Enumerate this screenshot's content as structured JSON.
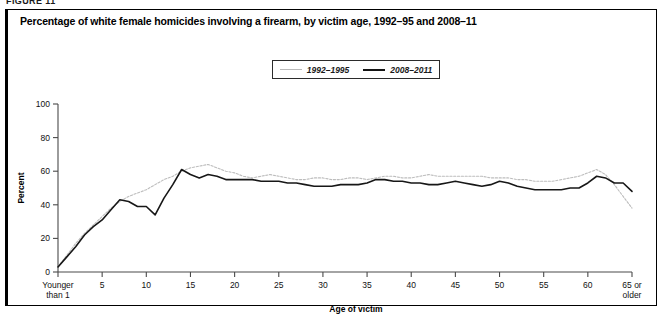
{
  "figure": {
    "number_label": "FIGURE 11",
    "title": "Percentage of white female homicides involving a firearm, by victim age, 1992–95 and 2008–11"
  },
  "legend": {
    "position": "top-center",
    "items": [
      {
        "label": "1992–1995",
        "style": "light-dotted",
        "color": "#bdbdbd"
      },
      {
        "label": "2008–2011",
        "style": "bold-solid",
        "color": "#171717"
      }
    ]
  },
  "axes": {
    "y_title": "Percent",
    "x_title": "Age of victim",
    "y_ticks": [
      "0",
      "20",
      "40",
      "60",
      "80",
      "100"
    ],
    "x_tick_labels": [
      "Younger than 1",
      "5",
      "10",
      "15",
      "20",
      "25",
      "30",
      "35",
      "40",
      "45",
      "50",
      "55",
      "60",
      "65 or older"
    ],
    "x_first_label_line1": "Younger",
    "x_first_label_line2": "than 1",
    "x_last_label_line1": "65 or",
    "x_last_label_line2": "older"
  },
  "chart_data": {
    "type": "line",
    "title": "Percentage of white female homicides involving a firearm, by victim age, 1992–95 and 2008–11",
    "xlabel": "Age of victim",
    "ylabel": "Percent",
    "xlim": [
      0,
      65
    ],
    "ylim": [
      0,
      100
    ],
    "grid": false,
    "legend_position": "top-center",
    "x": [
      0,
      1,
      2,
      3,
      4,
      5,
      6,
      7,
      8,
      9,
      10,
      11,
      12,
      13,
      14,
      15,
      16,
      17,
      18,
      19,
      20,
      21,
      22,
      23,
      24,
      25,
      26,
      27,
      28,
      29,
      30,
      31,
      32,
      33,
      34,
      35,
      36,
      37,
      38,
      39,
      40,
      41,
      42,
      43,
      44,
      45,
      46,
      47,
      48,
      49,
      50,
      51,
      52,
      53,
      54,
      55,
      56,
      57,
      58,
      59,
      60,
      61,
      62,
      63,
      64,
      65
    ],
    "x_tick_positions": [
      0,
      5,
      10,
      15,
      20,
      25,
      30,
      35,
      40,
      45,
      50,
      55,
      60,
      65
    ],
    "series": [
      {
        "name": "1992–1995",
        "color": "#bdbdbd",
        "style": "light-dotted",
        "values": [
          3,
          10,
          17,
          23,
          28,
          33,
          38,
          42,
          45,
          47,
          49,
          52,
          55,
          57,
          60,
          62,
          63,
          64,
          62,
          60,
          59,
          57,
          56,
          57,
          58,
          57,
          56,
          55,
          55,
          56,
          56,
          55,
          55,
          56,
          56,
          55,
          56,
          57,
          57,
          56,
          56,
          57,
          58,
          57,
          57,
          57,
          57,
          57,
          57,
          56,
          56,
          56,
          55,
          55,
          54,
          54,
          54,
          55,
          56,
          57,
          59,
          61,
          58,
          52,
          45,
          38
        ]
      },
      {
        "name": "2008–2011",
        "color": "#171717",
        "style": "bold-solid",
        "values": [
          3,
          9,
          15,
          22,
          27,
          31,
          37,
          43,
          42,
          39,
          39,
          34,
          44,
          52,
          61,
          58,
          56,
          58,
          57,
          55,
          55,
          55,
          55,
          54,
          54,
          54,
          53,
          53,
          52,
          51,
          51,
          51,
          52,
          52,
          52,
          53,
          55,
          55,
          54,
          54,
          53,
          53,
          52,
          52,
          53,
          54,
          53,
          52,
          51,
          52,
          54,
          53,
          51,
          50,
          49,
          49,
          49,
          49,
          50,
          50,
          53,
          57,
          56,
          53,
          53,
          48
        ]
      }
    ]
  }
}
